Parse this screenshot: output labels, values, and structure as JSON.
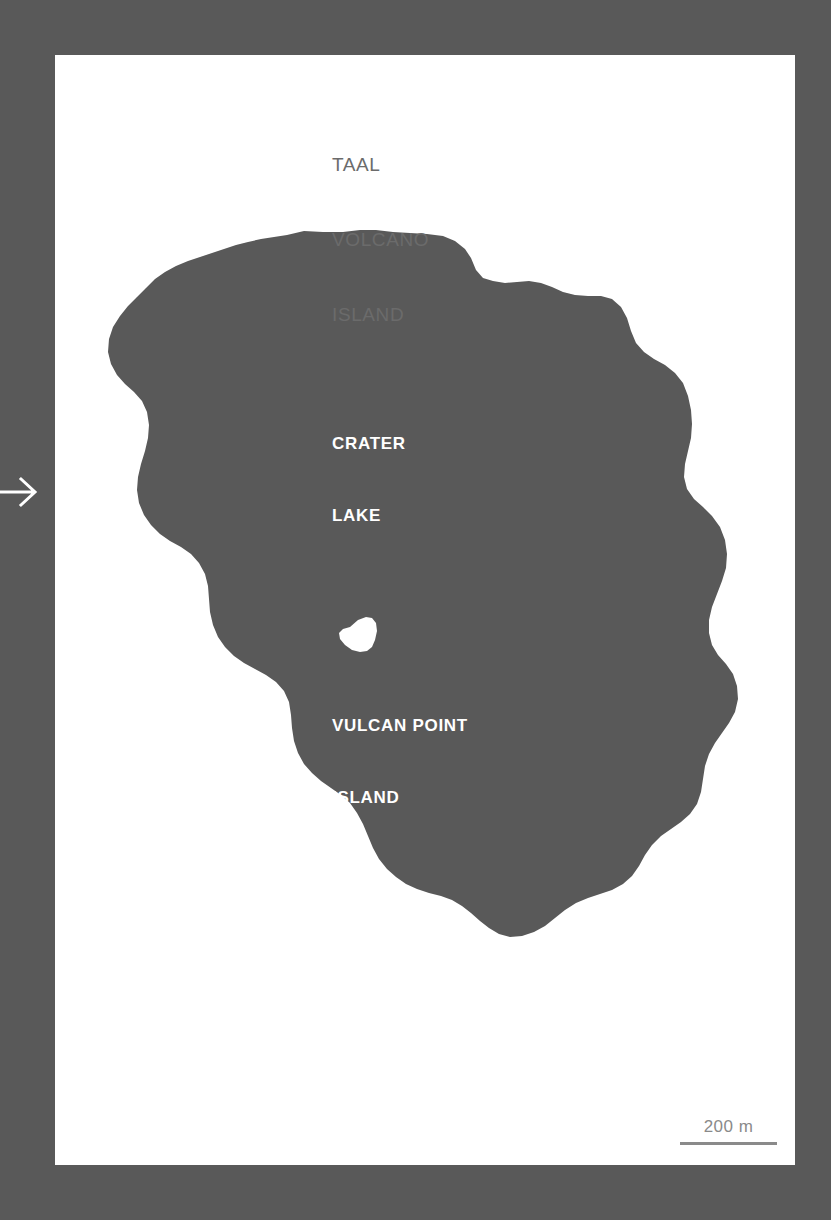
{
  "page": {
    "background_color": "#595959",
    "panel_color": "#ffffff",
    "water_color": "#595959",
    "island_color": "#ffffff",
    "label_color": "#ffffff",
    "title_color": "#6b6b6b",
    "scale_color": "#8a8a8a"
  },
  "title": {
    "line1": "TAAL",
    "line2": "VOLCANO",
    "line3": "ISLAND"
  },
  "labels": {
    "crater_lake": {
      "line1": "CRATER",
      "line2": "LAKE"
    },
    "vulcan_point": {
      "line1": "VULCAN POINT",
      "line2": "ISLAND"
    }
  },
  "scale": {
    "value": "200 m"
  },
  "icons": {
    "arrow": "arrow-right-icon"
  }
}
